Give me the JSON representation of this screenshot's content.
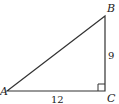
{
  "diagram": {
    "type": "right-triangle",
    "vertices": {
      "A": {
        "label": "A"
      },
      "B": {
        "label": "B"
      },
      "C": {
        "label": "C"
      }
    },
    "sides": {
      "BC": {
        "label": "9"
      },
      "AC": {
        "label": "12"
      }
    },
    "right_angle_at": "C",
    "colors": {
      "stroke": "#333333",
      "text": "#222222",
      "background": "#ffffff"
    }
  }
}
